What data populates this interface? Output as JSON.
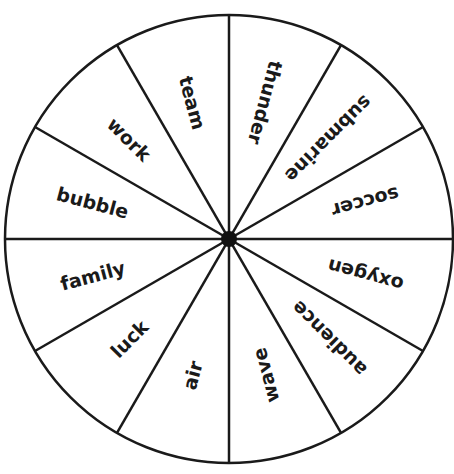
{
  "wheel": {
    "center": [
      229,
      239
    ],
    "radius": 224,
    "stroke_color": "#1a1a1a",
    "sectors": [
      {
        "label": "thunder",
        "angle": 15
      },
      {
        "label": "submarine",
        "angle": 45
      },
      {
        "label": "soccer",
        "angle": 75
      },
      {
        "label": "oxygen",
        "angle": 105
      },
      {
        "label": "audience",
        "angle": 135
      },
      {
        "label": "wave",
        "angle": 165
      },
      {
        "label": "air",
        "angle": 195
      },
      {
        "label": "luck",
        "angle": 225
      },
      {
        "label": "family",
        "angle": 255
      },
      {
        "label": "bubble",
        "angle": 285
      },
      {
        "label": "work",
        "angle": 315
      },
      {
        "label": "team",
        "angle": 345
      }
    ]
  }
}
